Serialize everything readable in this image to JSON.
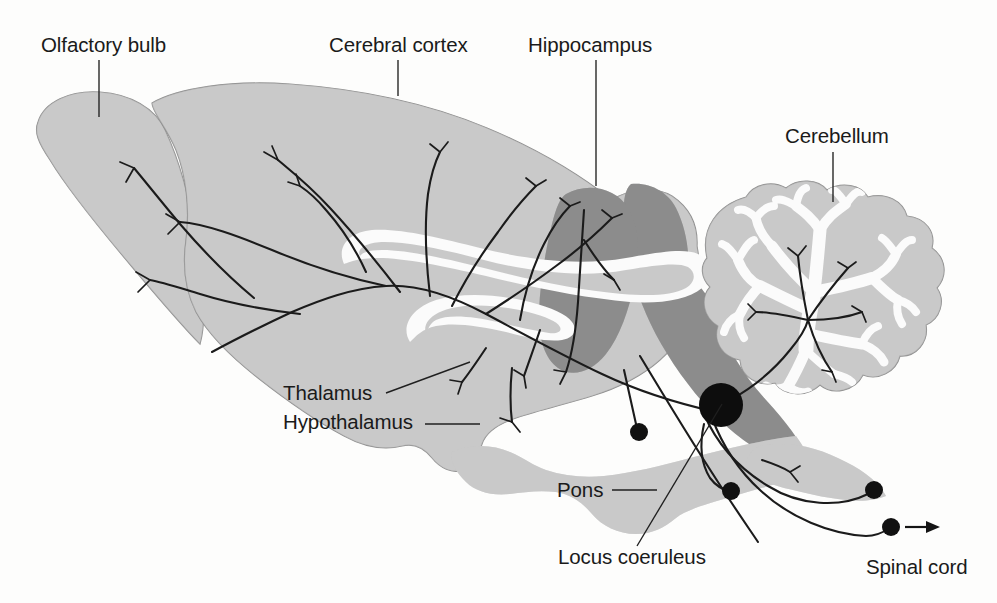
{
  "figure": {
    "background_color": "#ffffff"
  },
  "palette": {
    "light_gray": "#c9c9c9",
    "dark_gray": "#8d8d8d",
    "white_matter": "#fbfbfb",
    "outline": "#8e8e8e",
    "ink": "#1a1a1a"
  },
  "labels": [
    {
      "id": "olfactory-bulb",
      "text": "Olfactory bulb",
      "x": 41,
      "y": 52,
      "leader": "M 99 60 L 99 117"
    },
    {
      "id": "cerebral-cortex",
      "text": "Cerebral cortex",
      "x": 329,
      "y": 52,
      "leader": "M 398 60 L 398 96"
    },
    {
      "id": "hippocampus",
      "text": "Hippocampus",
      "x": 528,
      "y": 52,
      "leader": "M 596 60 L 596 186"
    },
    {
      "id": "cerebellum",
      "text": "Cerebellum",
      "x": 785,
      "y": 143,
      "leader": "M 833 152 L 833 202"
    },
    {
      "id": "thalamus",
      "text": "Thalamus",
      "x": 283,
      "y": 400,
      "leader": "M 386 393 L 470 362"
    },
    {
      "id": "hypothalamus",
      "text": "Hypothalamus",
      "x": 283,
      "y": 429,
      "leader": "M 425 424 L 480 424"
    },
    {
      "id": "pons",
      "text": "Pons",
      "x": 557,
      "y": 497,
      "leader": "M 612 490 L 657 490"
    },
    {
      "id": "locus-coeruleus",
      "text": "Locus coeruleus",
      "x": 558,
      "y": 564,
      "leader": "M 637 546 L 722 404"
    },
    {
      "id": "spinal-cord",
      "text": "Spinal cord",
      "x": 866,
      "y": 574,
      "leader": ""
    }
  ],
  "structures": [
    {
      "id": "olfactory-bulb-body",
      "name": "Olfactory bulb",
      "shade": "light_gray"
    },
    {
      "id": "cerebral-cortex-body",
      "name": "Cerebral cortex",
      "shade": "light_gray"
    },
    {
      "id": "corpus-callosum",
      "name": "Corpus callosum",
      "shade": "white_matter"
    },
    {
      "id": "fornix-ventricle",
      "name": "Lateral ventricle / fornix",
      "shade": "white_matter"
    },
    {
      "id": "hippocampus-body",
      "name": "Hippocampus",
      "shade": "dark_gray"
    },
    {
      "id": "midbrain-brainstem",
      "name": "Midbrain / brainstem core",
      "shade": "dark_gray"
    },
    {
      "id": "cerebellum-body",
      "name": "Cerebellum",
      "shade": "light_gray"
    },
    {
      "id": "cerebellum-arbor-vitae",
      "name": "Arbor vitae (cerebellar white matter)",
      "shade": "white_matter"
    },
    {
      "id": "pons-body",
      "name": "Pons",
      "shade": "light_gray"
    },
    {
      "id": "spinal-cord-body",
      "name": "Spinal cord",
      "shade": "light_gray"
    },
    {
      "id": "locus-coeruleus-nucleus",
      "name": "Locus coeruleus nucleus",
      "shade": "black"
    }
  ],
  "projection_system": {
    "origin": "Locus coeruleus",
    "soma_center": {
      "cx": 721,
      "cy": 405,
      "r": 22
    },
    "terminal_dots": [
      {
        "cx": 639,
        "cy": 432,
        "r": 9
      },
      {
        "cx": 731,
        "cy": 491,
        "r": 9
      },
      {
        "cx": 874,
        "cy": 490,
        "r": 9
      },
      {
        "cx": 891,
        "cy": 527,
        "r": 9
      }
    ],
    "arrow": {
      "x1": 906,
      "y1": 527,
      "x2": 934,
      "y2": 527
    },
    "targets": [
      "Olfactory bulb",
      "Cerebral cortex",
      "Hippocampus",
      "Thalamus",
      "Hypothalamus",
      "Cerebellum",
      "Pons",
      "Spinal cord"
    ]
  }
}
